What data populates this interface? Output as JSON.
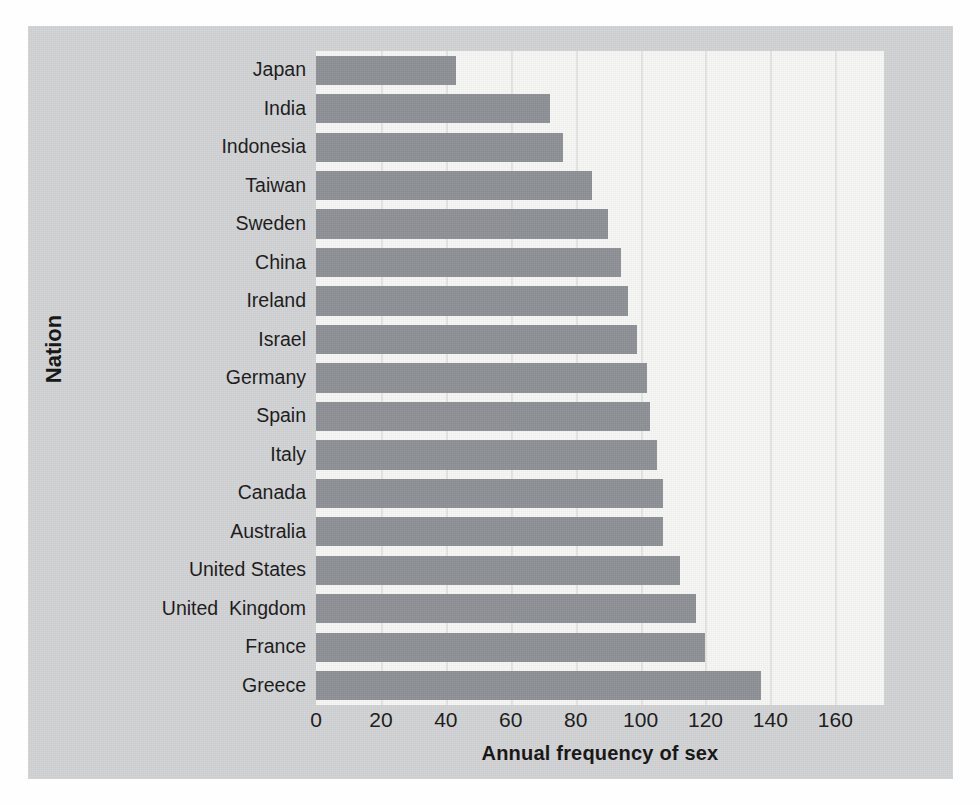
{
  "figure": {
    "background_color": "#d2d3d4",
    "plot_background_color": "#f7f7f6",
    "bar_color": "#8d9095",
    "gridline_color": "#e4e4e2",
    "text_color": "#171717"
  },
  "chart_data": {
    "type": "bar",
    "orientation": "horizontal",
    "title": "",
    "xlabel": "Annual frequency of sex",
    "ylabel": "Nation",
    "categories": [
      "Japan",
      "India",
      "Indonesia",
      "Taiwan",
      "Sweden",
      "China",
      "Ireland",
      "Israel",
      "Germany",
      "Spain",
      "Italy",
      "Canada",
      "Australia",
      "United States",
      "United  Kingdom",
      "France",
      "Greece"
    ],
    "values": [
      43,
      72,
      76,
      85,
      90,
      94,
      96,
      99,
      102,
      103,
      105,
      107,
      107,
      112,
      117,
      120,
      137
    ],
    "xlim": [
      0,
      175
    ],
    "xticks": [
      0,
      20,
      40,
      60,
      80,
      100,
      120,
      140,
      160
    ],
    "xticklabels": [
      "0",
      "20",
      "40",
      "60",
      "80",
      "100",
      "120",
      "140",
      "160"
    ],
    "grid": "vertical",
    "legend": null
  }
}
